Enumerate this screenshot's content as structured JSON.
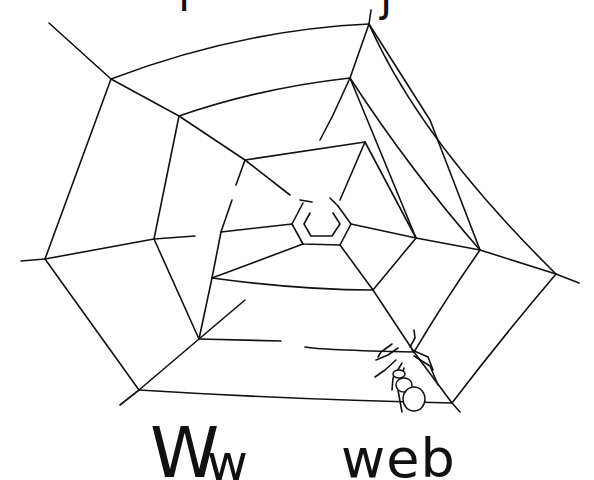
{
  "page": {
    "letter_upper": "W",
    "letter_lower": "w",
    "word": "web",
    "top_fragment_left": "l",
    "top_fragment_right": "j"
  },
  "illustration": {
    "subject": "spider-web",
    "has_spider": true,
    "line_color": "#111111",
    "background_color": "#ffffff"
  }
}
